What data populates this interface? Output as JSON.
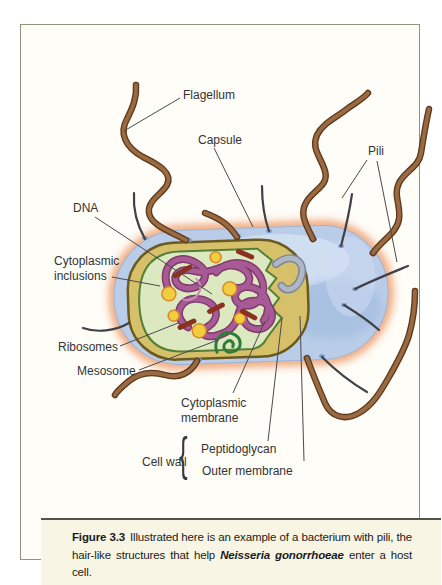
{
  "diagram": {
    "labels": {
      "flagellum": "Flagellum",
      "capsule": "Capsule",
      "pili": "Pili",
      "dna": "DNA",
      "cytoplasmic_inclusions": "Cytoplasmic\ninclusions",
      "ribosomes": "Ribosomes",
      "mesosome": "Mesosome",
      "cytoplasmic_membrane": "Cytoplasmic\nmembrane",
      "cell_wall": "Cell wall",
      "cell_wall_brace": "{",
      "peptidoglycan": "Peptidoglycan",
      "outer_membrane": "Outer membrane"
    }
  },
  "caption": {
    "figure_label": "Figure 3.3",
    "text_before_italic": "Illustrated here is an example of a bacterium with pili, the hair-like structures that help ",
    "species_name": "Neisseria gonorrhoeae",
    "text_after_italic": " enter a host cell."
  },
  "colors": {
    "page_background": "#ffffff",
    "panel_border": "#8d957c",
    "figure_background": "#fefdf8",
    "caption_background": "#f8f5e4",
    "caption_divider": "#50544a",
    "caption_text": "#1b1b1b",
    "label_text": "#333333",
    "capsule_blue": "#b9cde9",
    "capsule_glow_orange": "#f0a87d",
    "cell_wall_tan": "#d7c06a",
    "cell_wall_outline": "#6b5a20",
    "cytoplasm_green": "#dce9c0",
    "membrane_green": "#547f36",
    "dna_purple": "#a85a97",
    "dna_purple_dark": "#7c3168",
    "inclusion_yellow": "#f2cd3f",
    "ribosome_brown": "#8a3120",
    "mesosome_green": "#2d7c38",
    "flagellum_brown": "#9a6a42",
    "flagellum_outline": "#5d3a1c",
    "pilus_gray": "#3f4147",
    "leader_line": "#4a4a4a"
  }
}
